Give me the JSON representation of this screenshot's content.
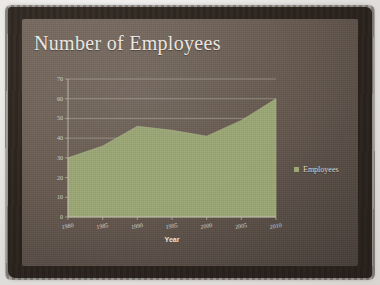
{
  "slide": {
    "title": "Number of Employees",
    "background_color": "#685C52",
    "legend": {
      "marker_icon": "square-marker-icon",
      "label": "Employees",
      "color": "#9CA876"
    }
  },
  "chart_data": {
    "type": "area",
    "title": "Number of Employees",
    "xlabel": "Year",
    "ylabel": "",
    "x": [
      1980,
      1985,
      1990,
      1995,
      2000,
      2005,
      2010
    ],
    "categories": [
      "1980",
      "1985",
      "1990",
      "1995",
      "2000",
      "2005",
      "2010"
    ],
    "series": [
      {
        "name": "Employees",
        "color": "#9CA876",
        "values": [
          30,
          36,
          46,
          44,
          41,
          49,
          60
        ]
      }
    ],
    "values": [
      30,
      36,
      46,
      44,
      41,
      49,
      60
    ],
    "xlim": [
      1980,
      2010
    ],
    "ylim": [
      0,
      70
    ],
    "yticks": [
      "0",
      "10",
      "20",
      "30",
      "40",
      "50",
      "60",
      "70"
    ],
    "xticks": [
      "1980",
      "1985",
      "1990",
      "1995",
      "2000",
      "2005",
      "2010"
    ],
    "grid": "horizontal",
    "legend_position": "right",
    "legend_entries": [
      "Employees"
    ]
  }
}
